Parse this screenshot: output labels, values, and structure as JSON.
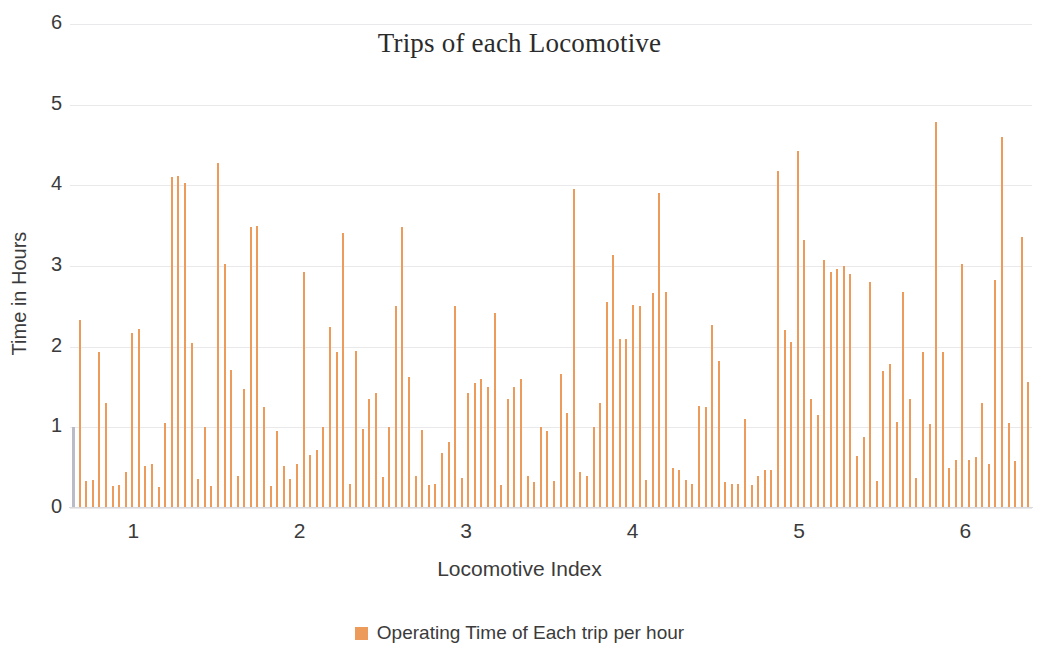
{
  "chart_data": {
    "type": "bar",
    "title": "Trips of each Locomotive",
    "xlabel": "Locomotive Index",
    "ylabel": "Time in Hours",
    "xlim": [
      0.62,
      6.4
    ],
    "ylim": [
      0,
      6
    ],
    "yticks": [
      0,
      1,
      2,
      3,
      4,
      5,
      6
    ],
    "xticks": [
      1,
      2,
      3,
      4,
      5,
      6
    ],
    "grid": true,
    "legend_position": "bottom",
    "series": [
      {
        "name": "Operating Time of Each trip per hour",
        "color": "#ED9B5B",
        "values": [
          1.0,
          2.33,
          0.33,
          0.35,
          1.93,
          1.3,
          0.27,
          0.28,
          0.45,
          2.17,
          2.22,
          0.52,
          0.55,
          0.26,
          1.05,
          4.1,
          4.12,
          4.03,
          2.05,
          0.36,
          1.0,
          0.27,
          4.28,
          3.02,
          1.71,
          0.4,
          1.48,
          3.48,
          3.49,
          1.25,
          0.27,
          0.95,
          0.52,
          0.36,
          0.55,
          2.93,
          0.66,
          0.72,
          1.0,
          2.25,
          1.93,
          3.41,
          0.3,
          1.95,
          0.98,
          1.35,
          1.43,
          0.39,
          1.0,
          2.51,
          3.48,
          1.62,
          0.4,
          0.97,
          0.28,
          0.3,
          0.68,
          0.82,
          2.5,
          0.37,
          1.42,
          1.55,
          1.6,
          1.5,
          2.42,
          0.28,
          1.35,
          1.5,
          1.6,
          0.4,
          0.32,
          1.0,
          0.95,
          0.34,
          1.66,
          1.18,
          3.96,
          0.45,
          0.4,
          1.0,
          1.3,
          2.55,
          3.14,
          2.1,
          2.1,
          2.52,
          2.5,
          0.35,
          2.67,
          3.9,
          2.68,
          0.5,
          0.47,
          0.35,
          0.3,
          1.27,
          1.25,
          2.27,
          1.82,
          0.32,
          0.3,
          0.3,
          1.1,
          0.28,
          0.4,
          0.47,
          0.47,
          4.18,
          2.21,
          2.06,
          4.43,
          3.32,
          1.35,
          1.15,
          3.08,
          2.92,
          2.96,
          3.0,
          2.9,
          0.65,
          0.88,
          2.8,
          0.33,
          1.7,
          1.78,
          1.07,
          2.68,
          1.35,
          0.37,
          1.94,
          1.04,
          4.78,
          1.93,
          0.5,
          0.6,
          3.02,
          0.6,
          0.63,
          1.3,
          0.55,
          2.83,
          4.6,
          1.05,
          0.58,
          3.36,
          1.56
        ],
        "gray_index": 0,
        "gray_color": "#b9bcc6"
      }
    ]
  },
  "legend": {
    "label": "Operating Time of Each trip per hour",
    "swatch_color": "#ED9B5B"
  },
  "axes": {
    "y_title": "Time in Hours",
    "x_title": "Locomotive Index",
    "y_tick_labels": [
      "0",
      "1",
      "2",
      "3",
      "4",
      "5",
      "6"
    ],
    "x_tick_labels": [
      "1",
      "2",
      "3",
      "4",
      "5",
      "6"
    ]
  },
  "title": "Trips of each Locomotive"
}
